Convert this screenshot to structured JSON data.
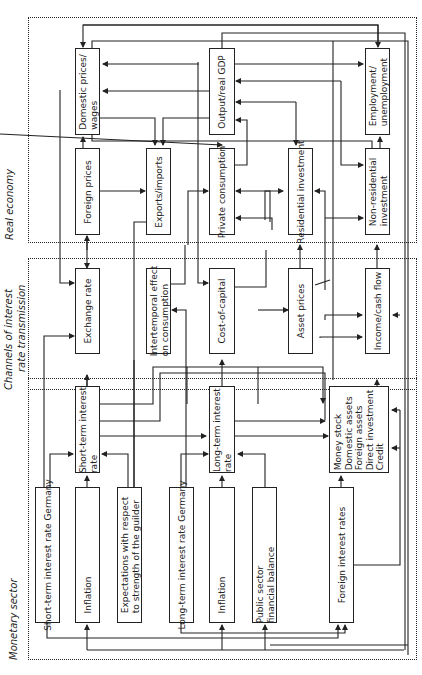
{
  "sectors": {
    "real_economy": "Real economy",
    "channels_line1": "Channels of interest",
    "channels_line2": "rate transmission",
    "monetary": "Monetary sector"
  },
  "real_economy": {
    "domestic_prices": [
      "Domestic prices/",
      "wages"
    ],
    "foreign_prices": "Foreign prices",
    "exports_imports": "Exports/imports",
    "output_gdp": "Output/real GDP",
    "private_consumption": "Private consumption",
    "residential_investment": "Residential investment",
    "employment": [
      "Employment/",
      "unemployment"
    ],
    "non_residential_investment": [
      "Non-residential",
      "investment"
    ]
  },
  "channels": {
    "exchange_rate": "Exchange rate",
    "intertemporal": [
      "Intertemporal effect",
      "on consumption"
    ],
    "cost_of_capital": "Cost-of-capital",
    "asset_prices": "Asset prices",
    "income_cash_flow": "Income/cash flow"
  },
  "monetary": {
    "short_term_rate": [
      "Short-term interest",
      "rate"
    ],
    "long_term_rate": [
      "Long-term interest",
      "rate"
    ],
    "money_stock": [
      "Money stock",
      "Domestic assets",
      "Foreign assets",
      "Direct investment",
      "Credit"
    ],
    "short_term_germany": "Short-term interest rate Germany",
    "inflation_1": "Inflation",
    "expectations": [
      "Expectations with respect",
      "to strength of the guilder"
    ],
    "long_term_germany": "Long-term interest rate Germany",
    "inflation_2": "Inflation",
    "public_sector": [
      "Public sector",
      "financial balance"
    ],
    "foreign_rates": "Foreign interest rates"
  }
}
